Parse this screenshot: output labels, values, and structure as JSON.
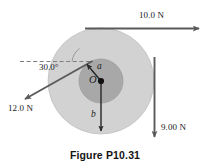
{
  "figure": {
    "caption": "Figure P10.31",
    "center_label": "O",
    "inner_radius_label": "a",
    "outer_radius_label": "b",
    "angle_label": "30.0°",
    "colors": {
      "outer_disk": "#d2d2d2",
      "inner_disk": "#a8a8a8",
      "arrow": "#5a5a5a",
      "text": "#1a1a1a",
      "background": "#ffffff"
    },
    "forces": [
      {
        "label": "10.0 N",
        "magnitude": "10.0",
        "unit": "N",
        "direction": "right",
        "application": "tangent-top-of-outer-circle"
      },
      {
        "label": "9.00 N",
        "magnitude": "9.00",
        "unit": "N",
        "direction": "down",
        "application": "tangent-right-of-outer-circle"
      },
      {
        "label": "12.0 N",
        "magnitude": "12.0",
        "unit": "N",
        "direction": "down-left-30-degrees-below-horizontal",
        "application": "tangent-to-inner-circle"
      }
    ],
    "geometry": {
      "center_x": 101,
      "center_y": 81,
      "outer_radius": 53,
      "inner_radius": 22
    }
  }
}
